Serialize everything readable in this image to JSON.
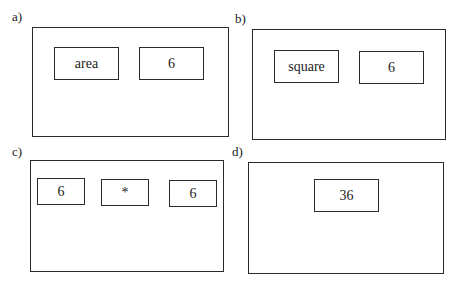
{
  "panels": [
    {
      "label": "a)",
      "cells": [
        "area",
        "6"
      ]
    },
    {
      "label": "b)",
      "cells": [
        "square",
        "6"
      ]
    },
    {
      "label": "c)",
      "cells": [
        "6",
        "*",
        "6"
      ]
    },
    {
      "label": "d)",
      "cells": [
        "36"
      ]
    }
  ]
}
